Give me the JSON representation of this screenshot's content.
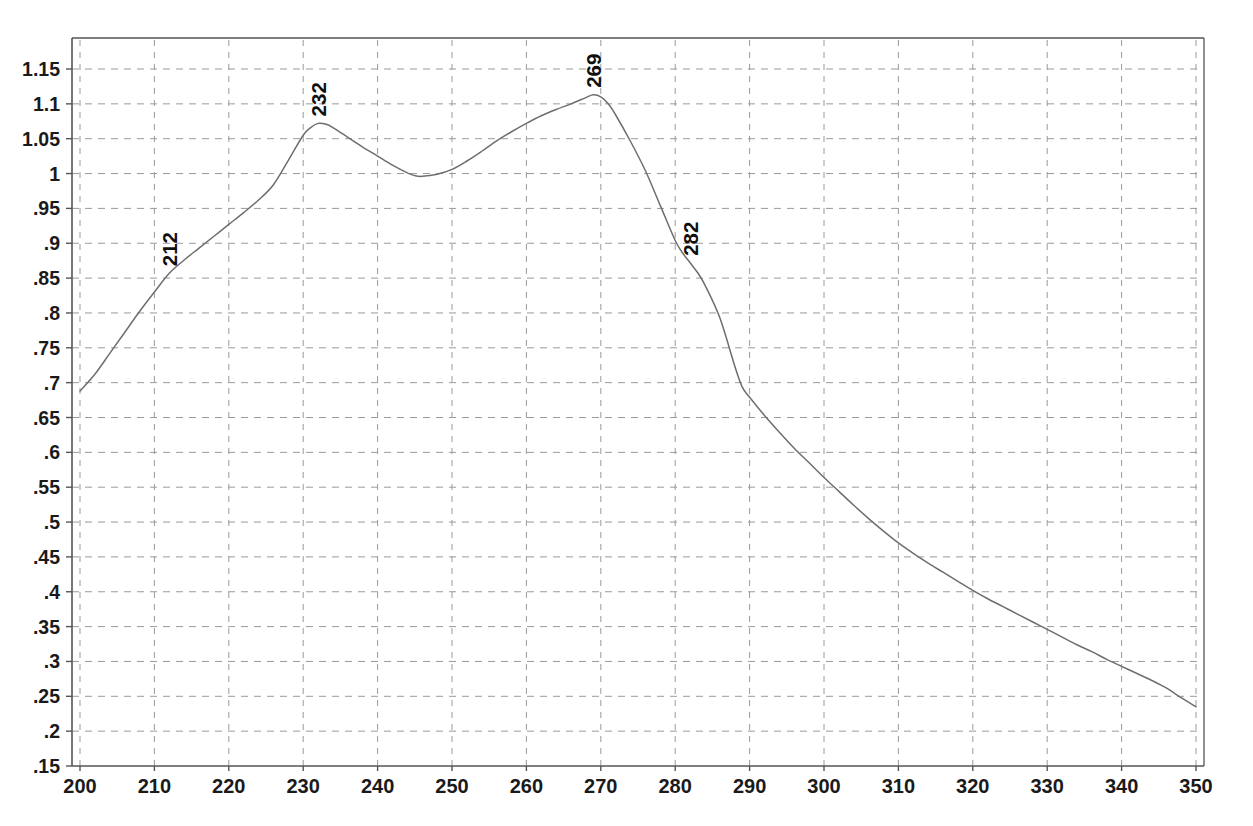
{
  "chart_data": {
    "type": "line",
    "title": "",
    "subtitle": "",
    "xlabel": "",
    "ylabel": "",
    "xlim": [
      200,
      350
    ],
    "ylim": [
      0.15,
      1.15
    ],
    "xticks": [
      200,
      210,
      220,
      230,
      240,
      250,
      260,
      270,
      280,
      290,
      300,
      310,
      320,
      330,
      340,
      350
    ],
    "xtick_labels": [
      "200",
      "210",
      "220",
      "230",
      "240",
      "250",
      "260",
      "270",
      "280",
      "290",
      "300",
      "310",
      "320",
      "330",
      "340",
      "350"
    ],
    "yticks": [
      0.15,
      0.2,
      0.25,
      0.3,
      0.35,
      0.4,
      0.45,
      0.5,
      0.55,
      0.6,
      0.65,
      0.7,
      0.75,
      0.8,
      0.85,
      0.9,
      0.95,
      1.0,
      1.05,
      1.1,
      1.15
    ],
    "ytick_labels": [
      ".15",
      ".2",
      ".25",
      ".3",
      ".35",
      ".4",
      ".45",
      ".5",
      ".55",
      ".6",
      ".65",
      ".7",
      ".75",
      ".8",
      ".85",
      ".9",
      ".95",
      "1",
      "1.05",
      "1.1",
      "1.15"
    ],
    "grid": true,
    "grid_style": "dashed",
    "legend": "none",
    "line_color": "#6e6e6e",
    "grid_color": "#9a9a9a",
    "axis_color": "#555555",
    "background_color": "#ffffff",
    "annotations": [
      {
        "label": "212",
        "x": 212,
        "y": 0.857,
        "rotation": -90
      },
      {
        "label": "232",
        "x": 232,
        "y": 1.072,
        "rotation": -90
      },
      {
        "label": "269",
        "x": 269,
        "y": 1.113,
        "rotation": -90
      },
      {
        "label": "282",
        "x": 282,
        "y": 0.872,
        "rotation": -90
      }
    ],
    "series": [
      {
        "name": "absorbance",
        "x": [
          200,
          202,
          204,
          206,
          208,
          210,
          212,
          214,
          216,
          218,
          220,
          222,
          224,
          226,
          228,
          230,
          231,
          232,
          233,
          234,
          236,
          238,
          240,
          242,
          244,
          245,
          246,
          248,
          250,
          252,
          254,
          256,
          258,
          260,
          262,
          264,
          266,
          268,
          269,
          270,
          271,
          272,
          274,
          276,
          278,
          280,
          281,
          282,
          283,
          284,
          286,
          288,
          289,
          290,
          292,
          294,
          296,
          298,
          300,
          302,
          304,
          306,
          308,
          310,
          312,
          314,
          316,
          318,
          320,
          322,
          324,
          326,
          328,
          330,
          332,
          334,
          336,
          338,
          340,
          342,
          344,
          346,
          348,
          350
        ],
        "y": [
          0.688,
          0.712,
          0.742,
          0.772,
          0.802,
          0.83,
          0.857,
          0.876,
          0.893,
          0.91,
          0.927,
          0.944,
          0.962,
          0.984,
          1.019,
          1.055,
          1.066,
          1.072,
          1.071,
          1.066,
          1.052,
          1.038,
          1.025,
          1.012,
          1.001,
          0.997,
          0.996,
          0.999,
          1.006,
          1.018,
          1.032,
          1.047,
          1.06,
          1.072,
          1.083,
          1.092,
          1.1,
          1.109,
          1.113,
          1.11,
          1.1,
          1.084,
          1.046,
          1.004,
          0.954,
          0.904,
          0.886,
          0.872,
          0.858,
          0.84,
          0.793,
          0.724,
          0.694,
          0.679,
          0.653,
          0.629,
          0.606,
          0.585,
          0.564,
          0.544,
          0.524,
          0.505,
          0.487,
          0.47,
          0.455,
          0.441,
          0.428,
          0.415,
          0.402,
          0.39,
          0.379,
          0.368,
          0.357,
          0.346,
          0.335,
          0.324,
          0.314,
          0.303,
          0.293,
          0.283,
          0.273,
          0.262,
          0.248,
          0.235
        ]
      }
    ]
  },
  "axes": {
    "plot_left_px": 72,
    "plot_right_px": 1204,
    "plot_top_px": 38,
    "plot_bottom_px": 766
  }
}
